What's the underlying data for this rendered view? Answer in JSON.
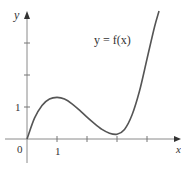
{
  "chart_data": {
    "type": "line",
    "title": "",
    "curve_label": "y = f(x)",
    "xlabel": "x",
    "ylabel": "y",
    "origin_label": "0",
    "x_tick_labels": [
      "1"
    ],
    "y_tick_labels": [
      "1"
    ],
    "x_ticks": [
      1,
      2,
      3,
      4
    ],
    "y_ticks": [
      1,
      2,
      3
    ],
    "xlim": [
      -0.7,
      5.1
    ],
    "ylim": [
      -0.7,
      4.0
    ],
    "grid": false,
    "series": [
      {
        "name": "f(x)",
        "x": [
          0,
          0.25,
          0.5,
          0.75,
          1.0,
          1.25,
          1.5,
          1.75,
          2.0,
          2.25,
          2.5,
          2.75,
          3.0,
          3.25,
          3.5,
          3.75,
          4.0,
          4.25,
          4.4
        ],
        "y": [
          0,
          0.65,
          1.05,
          1.25,
          1.3,
          1.25,
          1.1,
          0.9,
          0.68,
          0.48,
          0.3,
          0.18,
          0.15,
          0.3,
          0.75,
          1.5,
          2.5,
          3.5,
          4.0
        ]
      }
    ],
    "local_max": {
      "x": 1,
      "y": 1.3
    },
    "local_min": {
      "x": 3,
      "y": 0.15
    }
  },
  "colors": {
    "curve": "#555555",
    "axes": "#777777",
    "text": "#333333"
  }
}
